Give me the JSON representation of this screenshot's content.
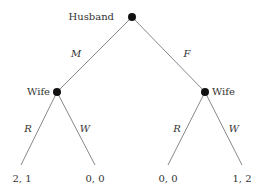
{
  "nodes": {
    "root": {
      "label": "Husband"
    },
    "left": {
      "label": "Wife"
    },
    "right": {
      "label": "Wife"
    }
  },
  "edges": {
    "root_left": "M",
    "root_right": "F",
    "left_left": "R",
    "left_right": "W",
    "right_left": "R",
    "right_right": "W"
  },
  "payoffs": [
    "2, 1",
    "0, 0",
    "0, 0",
    "1, 2"
  ]
}
